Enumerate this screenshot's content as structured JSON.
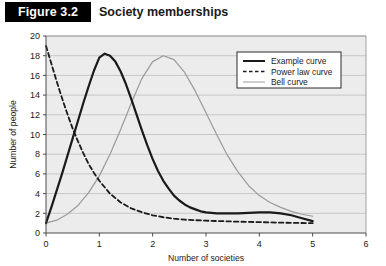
{
  "header": {
    "badge_label": "Figure 3.2",
    "title": "Society memberships",
    "badge_bg": "#000000",
    "badge_fg": "#ffffff"
  },
  "chart_data": {
    "type": "line",
    "title": "Society memberships",
    "xlabel": "Number of societies",
    "ylabel": "Number of people",
    "xlim": [
      0,
      6
    ],
    "ylim": [
      0,
      20
    ],
    "xticks": [
      0,
      1,
      2,
      3,
      4,
      5,
      6
    ],
    "yticks": [
      0,
      2,
      4,
      6,
      8,
      10,
      12,
      14,
      16,
      18,
      20
    ],
    "xtick_labels": [
      "0",
      "1",
      "2",
      "3",
      "4",
      "5",
      "6"
    ],
    "ytick_labels": [
      "0",
      "2",
      "4",
      "6",
      "8",
      "10",
      "12",
      "14",
      "16",
      "18",
      "20"
    ],
    "grid": "horizontal",
    "grid_color": "#b8b8b8",
    "plot_bg": "#ececec",
    "legend_position": "upper right",
    "series": [
      {
        "name": "Example curve",
        "style": "solid",
        "color": "#1a1a1a",
        "width": 2.2,
        "x": [
          0,
          0.1,
          0.2,
          0.3,
          0.4,
          0.5,
          0.6,
          0.7,
          0.8,
          0.9,
          1.0,
          1.1,
          1.2,
          1.3,
          1.4,
          1.5,
          1.6,
          1.7,
          1.8,
          1.9,
          2.0,
          2.1,
          2.2,
          2.3,
          2.4,
          2.5,
          2.6,
          2.7,
          2.8,
          2.9,
          3.0,
          3.2,
          3.4,
          3.6,
          3.8,
          4.0,
          4.2,
          4.4,
          4.6,
          4.8,
          5.0
        ],
        "y": [
          1.0,
          2.6,
          4.3,
          6.0,
          7.8,
          9.6,
          11.4,
          13.2,
          14.9,
          16.5,
          17.8,
          18.2,
          18.0,
          17.4,
          16.4,
          15.1,
          13.6,
          12.0,
          10.4,
          8.9,
          7.5,
          6.3,
          5.3,
          4.5,
          3.8,
          3.3,
          2.9,
          2.6,
          2.4,
          2.2,
          2.1,
          2.0,
          2.0,
          2.0,
          2.05,
          2.1,
          2.1,
          2.0,
          1.8,
          1.5,
          1.2
        ]
      },
      {
        "name": "Power law curve",
        "style": "dashed",
        "color": "#1a1a1a",
        "width": 1.8,
        "x": [
          0,
          0.1,
          0.2,
          0.3,
          0.4,
          0.5,
          0.6,
          0.7,
          0.8,
          0.9,
          1.0,
          1.2,
          1.4,
          1.6,
          1.8,
          2.0,
          2.2,
          2.4,
          2.6,
          2.8,
          3.0,
          3.3,
          3.6,
          4.0,
          4.4,
          4.7,
          5.0
        ],
        "y": [
          19.0,
          17.2,
          15.4,
          13.7,
          12.1,
          10.6,
          9.3,
          8.1,
          7.0,
          6.1,
          5.3,
          4.0,
          3.1,
          2.5,
          2.1,
          1.8,
          1.6,
          1.45,
          1.35,
          1.3,
          1.25,
          1.2,
          1.15,
          1.1,
          1.05,
          1.02,
          1.0
        ]
      },
      {
        "name": "Bell curve",
        "style": "solid",
        "color": "#9a9a9a",
        "width": 1.2,
        "x": [
          0,
          0.2,
          0.4,
          0.6,
          0.8,
          1.0,
          1.2,
          1.4,
          1.6,
          1.8,
          2.0,
          2.2,
          2.4,
          2.6,
          2.8,
          3.0,
          3.2,
          3.4,
          3.6,
          3.8,
          4.0,
          4.2,
          4.4,
          4.6,
          4.8,
          5.0
        ],
        "y": [
          1.0,
          1.3,
          1.9,
          2.8,
          4.1,
          5.8,
          8.0,
          10.5,
          13.2,
          15.7,
          17.4,
          18.0,
          17.6,
          16.3,
          14.4,
          12.2,
          10.0,
          7.9,
          6.2,
          4.8,
          3.8,
          3.1,
          2.6,
          2.2,
          1.9,
          1.7
        ]
      }
    ]
  },
  "legend": {
    "items": [
      {
        "label": "Example curve",
        "style": "solid",
        "color": "#1a1a1a"
      },
      {
        "label": "Power law curve",
        "style": "dashed",
        "color": "#1a1a1a"
      },
      {
        "label": "Bell curve",
        "style": "solid",
        "color": "#9a9a9a"
      }
    ]
  }
}
